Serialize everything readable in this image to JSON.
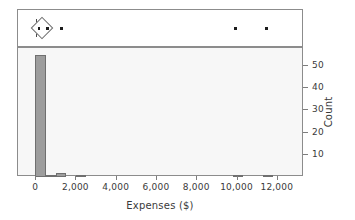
{
  "chart_data": {
    "type": "bar",
    "title": "",
    "subtitle": "",
    "xlabel": "Expenses ($)",
    "ylabel": "Count",
    "xlim": [
      -900,
      13300
    ],
    "ylim": [
      0,
      58
    ],
    "grid": false,
    "legend": null,
    "x_ticks": [
      {
        "value": 0,
        "label": "0"
      },
      {
        "value": 2000,
        "label": "2,000"
      },
      {
        "value": 4000,
        "label": "4,000"
      },
      {
        "value": 6000,
        "label": "6,000"
      },
      {
        "value": 8000,
        "label": "8,000"
      },
      {
        "value": 10000,
        "label": "10,000"
      },
      {
        "value": 12000,
        "label": "12,000"
      }
    ],
    "y_ticks": [
      {
        "value": 10,
        "label": "10"
      },
      {
        "value": 20,
        "label": "20"
      },
      {
        "value": 30,
        "label": "30"
      },
      {
        "value": 40,
        "label": "40"
      },
      {
        "value": 50,
        "label": "50"
      }
    ],
    "bin_width": 500,
    "categories": [
      "0-500",
      "500-1000",
      "1000-1500",
      "2000-2500",
      "9750-10250",
      "11250-11750"
    ],
    "bars": [
      {
        "x_start": -80,
        "x_end": 500,
        "count": 55
      },
      {
        "x_start": 500,
        "x_end": 1000,
        "count": 1
      },
      {
        "x_start": 1000,
        "x_end": 1500,
        "count": 2
      },
      {
        "x_start": 2000,
        "x_end": 2500,
        "count": 1
      },
      {
        "x_start": 9750,
        "x_end": 10250,
        "count": 1
      },
      {
        "x_start": 11250,
        "x_end": 11750,
        "count": 1
      }
    ],
    "values": [
      55,
      1,
      2,
      1,
      1,
      1
    ],
    "boxplot": {
      "type": "outlier-box-plot-with-mean-diamond",
      "whisker_low": 0,
      "whisker_high": 620,
      "mean": 310,
      "mean_diamond_low": 60,
      "mean_diamond_high": 620,
      "median": 300,
      "outliers": [
        1250,
        9900,
        11450
      ]
    },
    "colors": {
      "bar_fill": "#9d9d9d",
      "bar_border": "#6f6f6f",
      "panel_background": "#f7f7f7",
      "boxplot_background": "#ffffff",
      "frame": "#8c8c8c",
      "text": "#3a3a3a",
      "marker": "#1d1d1d"
    }
  }
}
